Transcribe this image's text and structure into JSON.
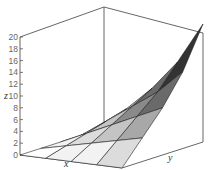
{
  "chart_data": {
    "type": "surface3d",
    "title": "",
    "xlabel": "x",
    "ylabel": "y",
    "zlabel": "z",
    "zlim": [
      0,
      20
    ],
    "z_ticks": [
      0,
      2,
      4,
      6,
      8,
      10,
      12,
      14,
      16,
      18,
      20
    ],
    "z_tick_labels": [
      "0",
      "2",
      "4",
      "6",
      "8",
      "10",
      "12",
      "14",
      "16",
      "18",
      "20"
    ],
    "grid": false,
    "legend": "none",
    "surface_grid_size": 5,
    "z_values": [
      [
        0,
        0,
        0,
        0,
        0
      ],
      [
        0,
        1,
        2,
        3,
        4
      ],
      [
        0,
        2,
        4,
        6,
        8
      ],
      [
        0,
        3,
        6,
        9,
        13
      ],
      [
        0,
        4,
        8,
        13,
        20
      ]
    ],
    "colors": {
      "frame": "#555555",
      "mesh": "#222222",
      "fill_light": "#e0e0e0",
      "fill_dark": "#333333"
    }
  }
}
